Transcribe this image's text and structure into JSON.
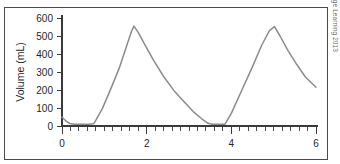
{
  "figure": {
    "copyright": "© Cengage Learning 2013",
    "top_caption_sliver": "",
    "frame_color": "#4a4a4a",
    "line_color": "#8b8b8b",
    "axis_color": "#3a3a3a",
    "background": "#ffffff"
  },
  "chart_data": {
    "type": "line",
    "title": "",
    "xlabel": "",
    "ylabel": "Volume (mL)",
    "xlim": [
      0,
      6
    ],
    "ylim": [
      0,
      600
    ],
    "grid": false,
    "legend": null,
    "x_ticks": [
      0,
      2,
      4,
      6
    ],
    "x_tick_labels": [
      "0",
      "2",
      "4",
      "6"
    ],
    "x_minor_tick_step": 0.2,
    "y_ticks": [
      0,
      100,
      200,
      300,
      400,
      500,
      600
    ],
    "y_tick_labels": [
      "0",
      "100",
      "200",
      "300",
      "400",
      "500",
      "600"
    ],
    "series": [
      {
        "name": "Volume",
        "color": "#8b8b8b",
        "x": [
          0.0,
          0.08,
          0.18,
          0.3,
          0.45,
          0.62,
          0.75,
          0.95,
          1.15,
          1.35,
          1.52,
          1.64,
          1.7,
          1.8,
          1.95,
          2.15,
          2.4,
          2.65,
          2.9,
          3.1,
          3.3,
          3.45,
          3.55,
          3.7,
          3.85,
          4.0,
          4.25,
          4.5,
          4.72,
          4.9,
          5.02,
          5.15,
          5.35,
          5.55,
          5.75,
          6.0
        ],
        "y": [
          50,
          30,
          14,
          10,
          10,
          10,
          12,
          95,
          205,
          320,
          440,
          525,
          555,
          520,
          455,
          370,
          275,
          195,
          130,
          80,
          40,
          15,
          10,
          10,
          10,
          70,
          200,
          330,
          450,
          530,
          552,
          500,
          415,
          340,
          272,
          215
        ]
      }
    ],
    "annotations": []
  }
}
